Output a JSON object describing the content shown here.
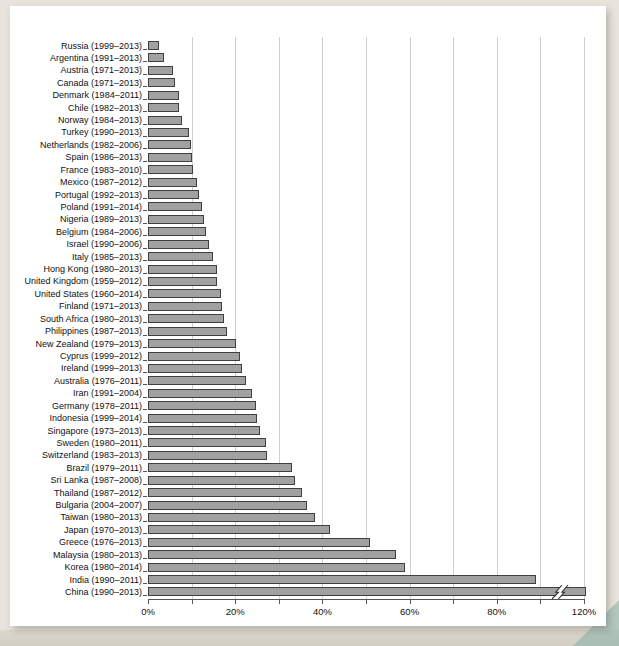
{
  "page": {
    "background_color": "#e8e4db",
    "panel_background": "#ffffff",
    "corner_accent_color": "#93b5ad"
  },
  "chart_data": {
    "type": "bar",
    "orientation": "horizontal",
    "title": "",
    "xlabel": "",
    "ylabel": "",
    "grid": true,
    "legend": "none",
    "bar_color": "#a1a1a1",
    "bar_border_color": "#3f3f3f",
    "x_tick_labels": [
      "0%",
      "20%",
      "40%",
      "60%",
      "80%",
      "120%"
    ],
    "x_tick_values": [
      0,
      20,
      40,
      60,
      80,
      120
    ],
    "gridline_values": [
      10,
      20,
      30,
      40,
      50,
      60,
      70,
      80,
      100,
      120
    ],
    "axis_break": {
      "after_value": 80,
      "compression": "segments after 80% represent 20% per gridline instead of 10%",
      "break_marker_on": "China (1990–2013)",
      "break_marker_value_position": 110
    },
    "xlim": [
      0,
      120
    ],
    "categories": [
      "Russia (1999–2013)",
      "Argentina (1991–2013)",
      "Austria (1971–2013)",
      "Canada (1971–2013)",
      "Denmark (1984–2011)",
      "Chile (1982–2013)",
      "Norway (1984–2013)",
      "Turkey (1990–2013)",
      "Netherlands (1982–2006)",
      "Spain (1986–2013)",
      "France (1983–2010)",
      "Mexico (1987–2012)",
      "Portugal (1992–2013)",
      "Poland (1991–2014)",
      "Nigeria (1989–2013)",
      "Belgium (1984–2006)",
      "Israel (1990–2006)",
      "Italy (1985–2013)",
      "Hong Kong (1980–2013)",
      "United Kingdom (1959–2012)",
      "United States (1960–2014)",
      "Finland (1971–2013)",
      "South Africa (1980–2013)",
      "Philippines (1987–2013)",
      "New Zealand (1979–2013)",
      "Cyprus (1999–2012)",
      "Ireland (1999–2013)",
      "Australia (1976–2011)",
      "Iran (1991–2004)",
      "Germany (1978–2011)",
      "Indonesia (1999–2014)",
      "Singapore (1973–2013)",
      "Sweden (1980–2011)",
      "Switzerland (1983–2013)",
      "Brazil (1979–2011)",
      "Sri Lanka (1987–2008)",
      "Thailand (1987–2012)",
      "Bulgaria (2004–2007)",
      "Taiwan (1980–2013)",
      "Japan (1970–2013)",
      "Greece (1976–2013)",
      "Malaysia (1980–2013)",
      "Korea (1980–2014)",
      "India (1990–2011)",
      "China (1990–2013)"
    ],
    "values": [
      2.5,
      3.7,
      5.8,
      6.2,
      7.0,
      7.1,
      7.8,
      9.5,
      9.8,
      10.0,
      10.3,
      11.3,
      11.7,
      12.3,
      12.8,
      13.3,
      13.9,
      14.9,
      15.8,
      15.9,
      16.8,
      16.9,
      17.5,
      18.2,
      20.2,
      21.1,
      21.5,
      22.5,
      23.8,
      24.8,
      25.1,
      25.7,
      27.0,
      27.3,
      33.1,
      33.8,
      35.4,
      36.5,
      38.2,
      41.8,
      51.0,
      56.8,
      59.0,
      98.0,
      121.0
    ]
  }
}
